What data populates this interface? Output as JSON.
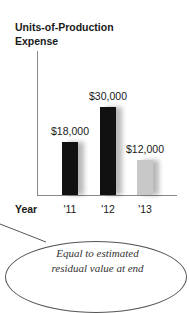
{
  "chart_data": {
    "type": "bar",
    "title": "Units-of-Production Expense",
    "xlabel": "Year",
    "ylabel": "",
    "categories": [
      "'11",
      "'12",
      "'13"
    ],
    "values": [
      18000,
      30000,
      12000
    ],
    "value_labels": [
      "$18,000",
      "$30,000",
      "$12,000"
    ],
    "colors": [
      "#111111",
      "#111111",
      "#c8c8c8"
    ],
    "ylim": [
      0,
      40000
    ],
    "grid": false,
    "annotations": [
      "Equal to estimated residual value at end"
    ]
  },
  "labels": {
    "title_line1": "Units-of-Production",
    "title_line2": "Expense",
    "x_title": "Year",
    "note_line1": "Equal to estimated",
    "note_line2": "residual value at end"
  }
}
